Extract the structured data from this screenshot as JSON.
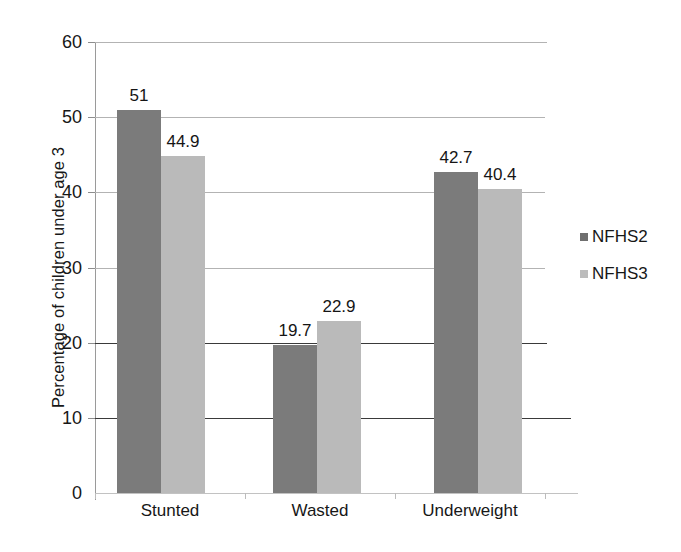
{
  "chart_data": {
    "type": "bar",
    "title": "",
    "subtitle": "",
    "xlabel": "",
    "ylabel": "Percentage of children under age 3",
    "categories": [
      "Stunted",
      "Wasted",
      "Underweight"
    ],
    "series": [
      {
        "name": "NFHS2",
        "color": "#7b7b7b",
        "values": [
          51,
          19.7,
          42.7
        ],
        "labels": [
          "51",
          "19.7",
          "42.7"
        ]
      },
      {
        "name": "NFHS3",
        "color": "#bababa",
        "values": [
          44.9,
          22.9,
          40.4
        ],
        "labels": [
          "44.9",
          "22.9",
          "40.4"
        ]
      }
    ],
    "ylim": [
      0,
      60
    ],
    "ytick_values": [
      0,
      10,
      20,
      30,
      40,
      50,
      60
    ],
    "ytick_labels": [
      "0",
      "10",
      "20",
      "30",
      "40",
      "50",
      "60"
    ],
    "grid": true,
    "grid_axis": "y",
    "legend_position": "right",
    "bar_labels_shown": true
  },
  "axis": {
    "y_title": "Percentage of children under age 3"
  },
  "legend": {
    "items": [
      {
        "label": "NFHS2"
      },
      {
        "label": "NFHS3"
      }
    ]
  }
}
